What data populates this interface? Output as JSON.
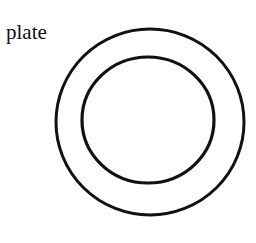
{
  "diagram": {
    "label": "plate",
    "stroke_color": "#111111",
    "background": "#ffffff",
    "shapes": [
      {
        "name": "outer-rim",
        "type": "ellipse",
        "cx": 150,
        "cy": 122,
        "rx": 94,
        "ry": 93
      },
      {
        "name": "inner-well",
        "type": "ellipse",
        "cx": 148,
        "cy": 120,
        "rx": 66,
        "ry": 63
      }
    ]
  }
}
